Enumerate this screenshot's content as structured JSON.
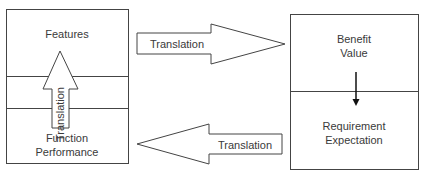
{
  "diagram": {
    "left_box": {
      "top_label": "Features",
      "bottom_label_line1": "Function",
      "bottom_label_line2": "Performance",
      "vertical_arrow_label": "Translation"
    },
    "right_box": {
      "top_label_line1": "Benefit",
      "top_label_line2": "Value",
      "bottom_label_line1": "Requirement",
      "bottom_label_line2": "Expectation"
    },
    "arrow_right_label": "Translation",
    "arrow_left_label": "Translation"
  },
  "colors": {
    "stroke": "#3a3a3a",
    "background": "#ffffff"
  }
}
